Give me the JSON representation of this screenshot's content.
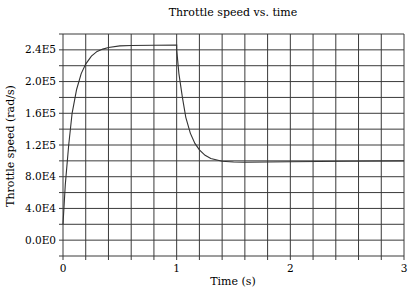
{
  "chart_data": {
    "type": "line",
    "title": "Throttle speed vs. time",
    "xlabel": "Time (s)",
    "ylabel": "Throttle speed (rad/s)",
    "xlim": [
      0,
      3
    ],
    "ylim": [
      -20000,
      260000
    ],
    "x_ticks": [
      0,
      1,
      2,
      3
    ],
    "x_tick_labels": [
      "0",
      "1",
      "2",
      "3"
    ],
    "x_minor_step": 0.2,
    "y_ticks": [
      0,
      40000,
      80000,
      120000,
      160000,
      200000,
      240000
    ],
    "y_tick_labels": [
      "0.0E0",
      "4.0E4",
      "8.0E4",
      "1.2E5",
      "1.6E5",
      "2.0E5",
      "2.4E5"
    ],
    "y_minor_step": 20000,
    "grid": true,
    "legend": null,
    "series": [
      {
        "name": "Throttle speed",
        "x": [
          0.0,
          0.02,
          0.05,
          0.08,
          0.12,
          0.16,
          0.2,
          0.25,
          0.3,
          0.35,
          0.4,
          0.5,
          0.6,
          0.8,
          1.0,
          1.0,
          1.02,
          1.05,
          1.08,
          1.12,
          1.16,
          1.2,
          1.25,
          1.3,
          1.4,
          1.5,
          1.6,
          1.8,
          2.0,
          2.5,
          3.0
        ],
        "values": [
          20000,
          70000,
          120000,
          160000,
          190000,
          210000,
          222000,
          232000,
          238000,
          241000,
          243000,
          245000,
          245500,
          245800,
          246000,
          240000,
          210000,
          180000,
          155000,
          135000,
          122000,
          114000,
          107000,
          103000,
          99500,
          98500,
          98300,
          98500,
          99000,
          99500,
          100000
        ]
      }
    ]
  }
}
